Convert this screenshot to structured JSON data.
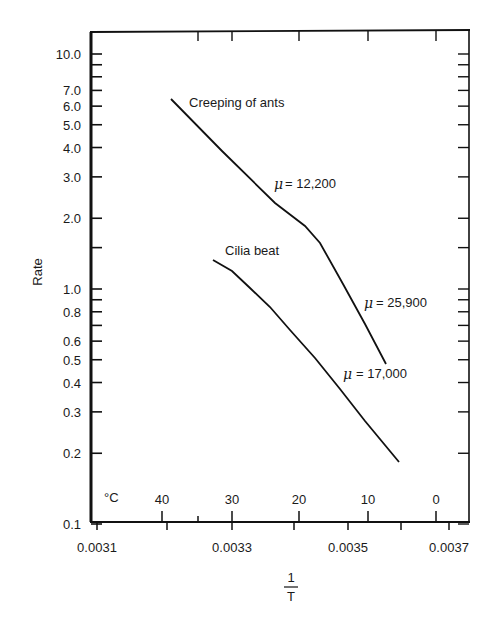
{
  "chart_data": {
    "type": "line",
    "title": "",
    "xlabel": "1/T",
    "xlabel_numerator": "1",
    "xlabel_denominator": "T",
    "ylabel": "Rate",
    "yscale": "log",
    "ylim": [
      0.1,
      12
    ],
    "xlim": [
      0.00309,
      0.00372
    ],
    "grid": false,
    "legend": "none (curves labeled inline)",
    "y_ticks": [
      {
        "value": 10.0,
        "label": "10.0"
      },
      {
        "value": 7.0,
        "label": "7.0"
      },
      {
        "value": 6.0,
        "label": "6.0"
      },
      {
        "value": 5.0,
        "label": "5.0"
      },
      {
        "value": 4.0,
        "label": "4.0"
      },
      {
        "value": 3.0,
        "label": "3.0"
      },
      {
        "value": 2.0,
        "label": "2.0"
      },
      {
        "value": 1.0,
        "label": "1.0"
      },
      {
        "value": 0.8,
        "label": "0.8"
      },
      {
        "value": 0.6,
        "label": "0.6"
      },
      {
        "value": 0.5,
        "label": "0.5"
      },
      {
        "value": 0.4,
        "label": "0.4"
      },
      {
        "value": 0.3,
        "label": "0.3"
      },
      {
        "value": 0.2,
        "label": "0.2"
      },
      {
        "value": 0.1,
        "label": "0.1"
      }
    ],
    "y_minor_ticks": [
      9.0,
      8.0,
      1.5,
      0.9,
      0.7
    ],
    "x_ticks": [
      {
        "value": 0.0031,
        "label": "0.0031"
      },
      {
        "value": 0.0032,
        "label": ""
      },
      {
        "value": 0.0033,
        "label": "0.0033"
      },
      {
        "value": 0.0034,
        "label": ""
      },
      {
        "value": 0.0035,
        "label": "0.0035"
      },
      {
        "value": 0.0036,
        "label": ""
      },
      {
        "value": 0.0037,
        "label": "0.0037"
      }
    ],
    "secondary_x_axis": {
      "unit_label": "°C",
      "ticks": [
        {
          "value": 40,
          "label": "40"
        },
        {
          "value": 35,
          "label": ""
        },
        {
          "value": 30,
          "label": "30"
        },
        {
          "value": 20,
          "label": "20"
        },
        {
          "value": 10,
          "label": "10"
        },
        {
          "value": 0,
          "label": "0"
        }
      ]
    },
    "series": [
      {
        "name": "Creeping of ants",
        "x": [
          0.00321,
          0.00345,
          0.00357
        ],
        "values": [
          6.2,
          1.5,
          0.48
        ],
        "segments": [
          {
            "label": "μ = 12,200",
            "range": [
              0.00321,
              0.00345
            ]
          },
          {
            "label": "μ = 25,900",
            "range": [
              0.00345,
              0.00357
            ]
          }
        ]
      },
      {
        "name": "Cilia beat",
        "x": [
          0.00328,
          0.00333,
          0.00339,
          0.00346,
          0.00353,
          0.0036
        ],
        "values": [
          1.33,
          1.0,
          0.7,
          0.45,
          0.29,
          0.18
        ],
        "segments": [
          {
            "label": "μ = 17,000",
            "range": [
              0.00328,
              0.0036
            ]
          }
        ]
      }
    ],
    "annotations": [
      {
        "text": "Creeping of ants",
        "x": 0.00322,
        "y": 6.2
      },
      {
        "text": "μ = 12,200",
        "x": 0.0034,
        "y": 2.8
      },
      {
        "text": "Cilia beat",
        "x": 0.0033,
        "y": 1.4
      },
      {
        "text": "μ = 25,900",
        "x": 0.00352,
        "y": 0.9
      },
      {
        "text": "μ = 17,000",
        "x": 0.0035,
        "y": 0.42
      }
    ]
  },
  "labels": {
    "ylabel": "Rate",
    "x_numerator": "1",
    "x_denominator": "T",
    "celsius_unit": "°C",
    "ants_label": "Creeping of ants",
    "cilia_label": "Cilia beat",
    "mu_symbol": "μ",
    "mu_ants_low": "= 12,200",
    "mu_ants_high": "= 25,900",
    "mu_cilia": "= 17,000"
  }
}
